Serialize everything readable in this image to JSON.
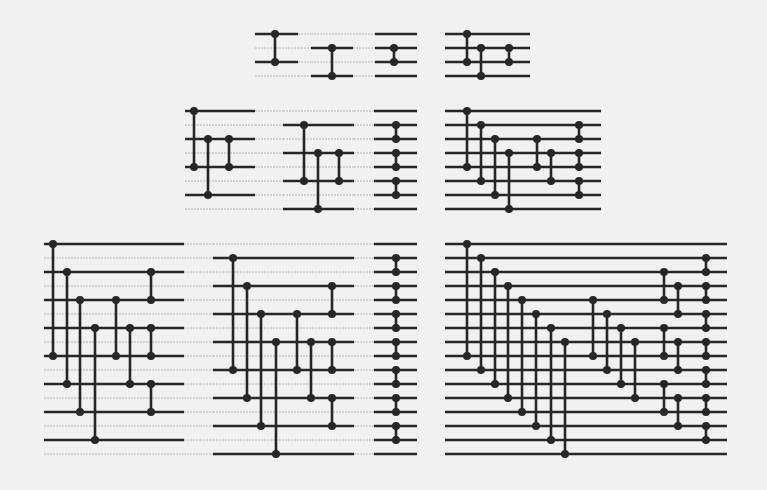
{
  "figure": {
    "colors": {
      "ink": "#262626",
      "faint_line": "#b4b4b0",
      "paper": "#f1f1ef"
    },
    "line_stroke": 2.6,
    "wire_stroke": 2.6,
    "dot_radius": 4,
    "networks": [
      {
        "id": "n4-stage-1",
        "lines_y": [
          34,
          48,
          62,
          76
        ],
        "segments": [
          {
            "x1": 255,
            "x2": 298,
            "solid": [
              0,
              2
            ]
          },
          {
            "x1": 298,
            "x2": 311,
            "solid": []
          }
        ],
        "comparators": [
          {
            "x": 275,
            "a": 0,
            "b": 2
          }
        ]
      },
      {
        "id": "n4-stage-2",
        "lines_y": [
          34,
          48,
          62,
          76
        ],
        "segments": [
          {
            "x1": 311,
            "x2": 353,
            "solid": [
              1,
              3
            ]
          },
          {
            "x1": 353,
            "x2": 375,
            "solid": []
          }
        ],
        "comparators": [
          {
            "x": 332,
            "a": 1,
            "b": 3
          }
        ]
      },
      {
        "id": "n4-stage-3",
        "lines_y": [
          34,
          48,
          62,
          76
        ],
        "segments": [
          {
            "x1": 375,
            "x2": 417,
            "solid": [
              0,
              1,
              2,
              3
            ]
          }
        ],
        "comparators": [
          {
            "x": 394,
            "a": 1,
            "b": 2
          }
        ]
      },
      {
        "id": "n4-combined",
        "lines_y": [
          34,
          48,
          62,
          76
        ],
        "segments": [
          {
            "x1": 445,
            "x2": 530,
            "solid": [
              0,
              1,
              2,
              3
            ]
          }
        ],
        "comparators": [
          {
            "x": 467,
            "a": 0,
            "b": 2
          },
          {
            "x": 481,
            "a": 1,
            "b": 3
          },
          {
            "x": 509,
            "a": 1,
            "b": 2
          }
        ]
      },
      {
        "id": "n8-stage-1",
        "lines_y": [
          111,
          125,
          139,
          153,
          167,
          181,
          195,
          209
        ],
        "segments": [
          {
            "x1": 185,
            "x2": 255,
            "solid": [
              0,
              2,
              4,
              6
            ]
          },
          {
            "x1": 255,
            "x2": 283,
            "solid": []
          }
        ],
        "comparators": [
          {
            "x": 194,
            "a": 0,
            "b": 4
          },
          {
            "x": 208,
            "a": 2,
            "b": 6
          },
          {
            "x": 229,
            "a": 2,
            "b": 4
          }
        ]
      },
      {
        "id": "n8-stage-2",
        "lines_y": [
          111,
          125,
          139,
          153,
          167,
          181,
          195,
          209
        ],
        "segments": [
          {
            "x1": 283,
            "x2": 354,
            "solid": [
              1,
              3,
              5,
              7
            ]
          },
          {
            "x1": 354,
            "x2": 374,
            "solid": []
          }
        ],
        "comparators": [
          {
            "x": 304,
            "a": 1,
            "b": 5
          },
          {
            "x": 318,
            "a": 3,
            "b": 7
          },
          {
            "x": 339,
            "a": 3,
            "b": 5
          }
        ]
      },
      {
        "id": "n8-stage-3",
        "lines_y": [
          111,
          125,
          139,
          153,
          167,
          181,
          195,
          209
        ],
        "segments": [
          {
            "x1": 374,
            "x2": 417,
            "solid": [
              0,
              1,
              2,
              3,
              4,
              5,
              6,
              7
            ]
          }
        ],
        "comparators": [
          {
            "x": 396,
            "a": 1,
            "b": 2
          },
          {
            "x": 396,
            "a": 3,
            "b": 4
          },
          {
            "x": 396,
            "a": 5,
            "b": 6
          }
        ]
      },
      {
        "id": "n8-combined",
        "lines_y": [
          111,
          125,
          139,
          153,
          167,
          181,
          195,
          209
        ],
        "segments": [
          {
            "x1": 445,
            "x2": 601,
            "solid": [
              0,
              1,
              2,
              3,
              4,
              5,
              6,
              7
            ]
          }
        ],
        "comparators": [
          {
            "x": 467,
            "a": 0,
            "b": 4
          },
          {
            "x": 481,
            "a": 1,
            "b": 5
          },
          {
            "x": 495,
            "a": 2,
            "b": 6
          },
          {
            "x": 509,
            "a": 3,
            "b": 7
          },
          {
            "x": 537,
            "a": 2,
            "b": 4
          },
          {
            "x": 551,
            "a": 3,
            "b": 5
          },
          {
            "x": 579,
            "a": 1,
            "b": 2
          },
          {
            "x": 579,
            "a": 3,
            "b": 4
          },
          {
            "x": 579,
            "a": 5,
            "b": 6
          }
        ]
      },
      {
        "id": "n16-stage-1",
        "lines_y": [
          244,
          258,
          272,
          286,
          300,
          314,
          328,
          342,
          356,
          370,
          384,
          398,
          412,
          426,
          440,
          454
        ],
        "segments": [
          {
            "x1": 44,
            "x2": 184,
            "solid": [
              0,
              2,
              4,
              6,
              8,
              10,
              12,
              14
            ]
          },
          {
            "x1": 184,
            "x2": 200,
            "solid": []
          }
        ],
        "comparators": [
          {
            "x": 53,
            "a": 0,
            "b": 8
          },
          {
            "x": 67,
            "a": 2,
            "b": 10
          },
          {
            "x": 80,
            "a": 4,
            "b": 12
          },
          {
            "x": 95,
            "a": 6,
            "b": 14
          },
          {
            "x": 116,
            "a": 4,
            "b": 8
          },
          {
            "x": 130,
            "a": 6,
            "b": 10
          },
          {
            "x": 151,
            "a": 2,
            "b": 4
          },
          {
            "x": 151,
            "a": 6,
            "b": 8
          },
          {
            "x": 151,
            "a": 10,
            "b": 12
          }
        ]
      },
      {
        "id": "n16-stage-2",
        "lines_y": [
          244,
          258,
          272,
          286,
          300,
          314,
          328,
          342,
          356,
          370,
          384,
          398,
          412,
          426,
          440,
          454
        ],
        "segments": [
          {
            "x1": 213,
            "x2": 354,
            "solid": [
              1,
              3,
              5,
              7,
              9,
              11,
              13,
              15
            ]
          },
          {
            "x1": 200,
            "x2": 213,
            "solid": []
          },
          {
            "x1": 354,
            "x2": 374,
            "solid": []
          }
        ],
        "comparators": [
          {
            "x": 233,
            "a": 1,
            "b": 9
          },
          {
            "x": 247,
            "a": 3,
            "b": 11
          },
          {
            "x": 261,
            "a": 5,
            "b": 13
          },
          {
            "x": 276,
            "a": 7,
            "b": 15
          },
          {
            "x": 297,
            "a": 5,
            "b": 9
          },
          {
            "x": 311,
            "a": 7,
            "b": 11
          },
          {
            "x": 332,
            "a": 3,
            "b": 5
          },
          {
            "x": 332,
            "a": 7,
            "b": 9
          },
          {
            "x": 332,
            "a": 11,
            "b": 13
          }
        ]
      },
      {
        "id": "n16-stage-3",
        "lines_y": [
          244,
          258,
          272,
          286,
          300,
          314,
          328,
          342,
          356,
          370,
          384,
          398,
          412,
          426,
          440,
          454
        ],
        "segments": [
          {
            "x1": 374,
            "x2": 417,
            "solid": [
              0,
              1,
              2,
              3,
              4,
              5,
              6,
              7,
              8,
              9,
              10,
              11,
              12,
              13,
              14,
              15
            ]
          }
        ],
        "comparators": [
          {
            "x": 396,
            "a": 1,
            "b": 2
          },
          {
            "x": 396,
            "a": 3,
            "b": 4
          },
          {
            "x": 396,
            "a": 5,
            "b": 6
          },
          {
            "x": 396,
            "a": 7,
            "b": 8
          },
          {
            "x": 396,
            "a": 9,
            "b": 10
          },
          {
            "x": 396,
            "a": 11,
            "b": 12
          },
          {
            "x": 396,
            "a": 13,
            "b": 14
          }
        ]
      },
      {
        "id": "n16-combined",
        "lines_y": [
          244,
          258,
          272,
          286,
          300,
          314,
          328,
          342,
          356,
          370,
          384,
          398,
          412,
          426,
          440,
          454
        ],
        "segments": [
          {
            "x1": 445,
            "x2": 727,
            "solid": [
              0,
              1,
              2,
              3,
              4,
              5,
              6,
              7,
              8,
              9,
              10,
              11,
              12,
              13,
              14,
              15
            ]
          }
        ],
        "comparators": [
          {
            "x": 467,
            "a": 0,
            "b": 8
          },
          {
            "x": 481,
            "a": 1,
            "b": 9
          },
          {
            "x": 495,
            "a": 2,
            "b": 10
          },
          {
            "x": 508,
            "a": 3,
            "b": 11
          },
          {
            "x": 522,
            "a": 4,
            "b": 12
          },
          {
            "x": 536,
            "a": 5,
            "b": 13
          },
          {
            "x": 551,
            "a": 6,
            "b": 14
          },
          {
            "x": 565,
            "a": 7,
            "b": 15
          },
          {
            "x": 593,
            "a": 4,
            "b": 8
          },
          {
            "x": 607,
            "a": 5,
            "b": 9
          },
          {
            "x": 621,
            "a": 6,
            "b": 10
          },
          {
            "x": 635,
            "a": 7,
            "b": 11
          },
          {
            "x": 664,
            "a": 2,
            "b": 4
          },
          {
            "x": 678,
            "a": 3,
            "b": 5
          },
          {
            "x": 664,
            "a": 6,
            "b": 8
          },
          {
            "x": 678,
            "a": 7,
            "b": 9
          },
          {
            "x": 664,
            "a": 10,
            "b": 12
          },
          {
            "x": 678,
            "a": 11,
            "b": 13
          },
          {
            "x": 706,
            "a": 1,
            "b": 2
          },
          {
            "x": 706,
            "a": 3,
            "b": 4
          },
          {
            "x": 706,
            "a": 5,
            "b": 6
          },
          {
            "x": 706,
            "a": 7,
            "b": 8
          },
          {
            "x": 706,
            "a": 9,
            "b": 10
          },
          {
            "x": 706,
            "a": 11,
            "b": 12
          },
          {
            "x": 706,
            "a": 13,
            "b": 14
          }
        ]
      }
    ]
  }
}
